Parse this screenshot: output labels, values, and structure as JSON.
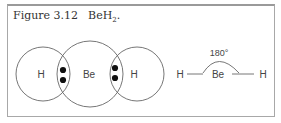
{
  "figure": {
    "label": "Figure 3.12",
    "formula_main": "BeH",
    "formula_sub": "2",
    "formula_end": "."
  },
  "lewis_diagram": {
    "atoms": [
      "H",
      "Be",
      "H"
    ],
    "shared_pairs": 2
  },
  "structural_diagram": {
    "left_atom": "H",
    "center_atom": "Be",
    "right_atom": "H",
    "bond_angle": "180°"
  },
  "colors": {
    "line": "#666666",
    "dot": "#111111",
    "border": "#a8a8a8"
  }
}
